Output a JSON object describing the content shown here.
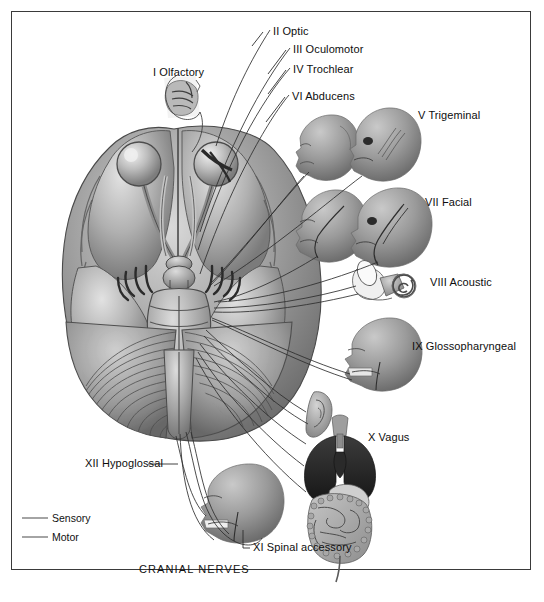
{
  "figure": {
    "caption": "CRANIAL NERVES",
    "frame_color": "#3a3a3a",
    "background": "#ffffff",
    "ink_color": "#1a1a1a"
  },
  "central_illustration": {
    "name": "inferior-view-of-brain",
    "description": "Inferior (ventral) surface of the human brain showing frontal lobes, optic chiasm, temporal lobes, brainstem (midbrain, pons, medulla) and cerebellum, with cranial nerve roots emerging.",
    "structures": [
      "frontal lobe",
      "olfactory bulb",
      "optic nerve",
      "optic chiasm",
      "temporal lobe",
      "pituitary stalk",
      "midbrain",
      "pons",
      "medulla oblongata",
      "cerebellum"
    ]
  },
  "labels": [
    {
      "id": "I",
      "text": "I Olfactory",
      "x": 153,
      "y": 67,
      "anchor": "start",
      "target": "olfactory-mucosa-inset"
    },
    {
      "id": "II",
      "text": "II Optic",
      "x": 273,
      "y": 26,
      "anchor": "start",
      "target": "optic-nerve"
    },
    {
      "id": "III",
      "text": "III Oculomotor",
      "x": 293,
      "y": 44,
      "anchor": "start",
      "target": "oculomotor-nerve"
    },
    {
      "id": "IV",
      "text": "IV Trochlear",
      "x": 293,
      "y": 64,
      "anchor": "start",
      "target": "trochlear-nerve"
    },
    {
      "id": "VI",
      "text": "VI Abducens",
      "x": 292,
      "y": 91,
      "anchor": "start",
      "target": "abducens-nerve"
    },
    {
      "id": "V",
      "text": "V Trigeminal",
      "x": 418,
      "y": 110,
      "anchor": "start",
      "target": "trigeminal-head"
    },
    {
      "id": "VII",
      "text": "VII Facial",
      "x": 425,
      "y": 197,
      "anchor": "start",
      "target": "facial-head"
    },
    {
      "id": "VIII",
      "text": "VIII Acoustic",
      "x": 430,
      "y": 277,
      "anchor": "start",
      "target": "inner-ear"
    },
    {
      "id": "IX",
      "text": "IX Glossopharyngeal",
      "x": 412,
      "y": 345,
      "anchor": "start",
      "target": "glossopharyngeal-head"
    },
    {
      "id": "X",
      "text": "X Vagus",
      "x": 368,
      "y": 437,
      "anchor": "start",
      "target": "viscera"
    },
    {
      "id": "XII",
      "text": "XII Hypoglossal",
      "x": 85,
      "y": 458,
      "anchor": "start",
      "target": "hypoglossal-head"
    },
    {
      "id": "XI",
      "text": "XI Spinal accessory",
      "x": 253,
      "y": 546,
      "anchor": "start",
      "target": "spinal-accessory"
    }
  ],
  "legend": {
    "items": [
      {
        "name": "sensory",
        "label": "Sensory",
        "line_color": "#5a5a5a",
        "line_width": 1.1,
        "x": 52,
        "y": 518
      },
      {
        "name": "motor",
        "label": "Motor",
        "line_color": "#5a5a5a",
        "line_width": 1.1,
        "x": 52,
        "y": 537
      }
    ],
    "swatch_x1": 22,
    "swatch_x2": 48
  },
  "insets": [
    {
      "name": "olfactory-mucosa-inset",
      "cx": 178,
      "cy": 96,
      "label_ref": "I"
    },
    {
      "name": "abducens-head",
      "cx": 318,
      "cy": 140,
      "label_ref": "VI"
    },
    {
      "name": "trigeminal-head",
      "cx": 383,
      "cy": 137,
      "label_ref": "V"
    },
    {
      "name": "facial-head-left",
      "cx": 384,
      "cy": 215,
      "label_ref": "VII"
    },
    {
      "name": "facial-head-right",
      "cx": 324,
      "cy": 218,
      "label_ref": "VII"
    },
    {
      "name": "inner-ear",
      "cx": 388,
      "cy": 285,
      "label_ref": "VIII"
    },
    {
      "name": "glossopharyngeal-head",
      "cx": 382,
      "cy": 344,
      "label_ref": "IX"
    },
    {
      "name": "vagus-ear",
      "cx": 322,
      "cy": 405,
      "label_ref": "X"
    },
    {
      "name": "vagus-viscera",
      "cx": 338,
      "cy": 470,
      "label_ref": "X"
    },
    {
      "name": "hypoglossal-head",
      "cx": 244,
      "cy": 497,
      "label_ref": "XII"
    }
  ]
}
